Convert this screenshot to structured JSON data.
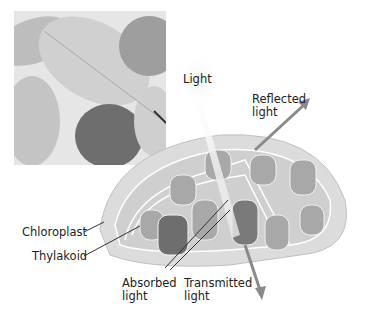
{
  "figure": {
    "photo": {
      "description": "Photograph of leaves (grayscale)",
      "icon": "leaves-photo"
    },
    "labels": {
      "light": "Light",
      "reflected": "Reflected\nlight",
      "chloroplast": "Chloroplast",
      "thylakoid": "Thylakoid",
      "absorbed": "Absorbed\nlight",
      "transmitted": "Transmitted\nlight"
    },
    "colors": {
      "background": "#ffffff",
      "arrow": "#8a8a8a",
      "chloroplast_fill": "#d6d6d6",
      "thylakoid_fill": "#9a9a9a",
      "text": "#222222"
    }
  }
}
